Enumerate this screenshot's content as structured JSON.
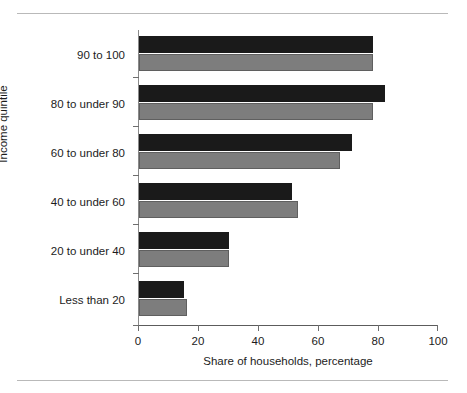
{
  "chart_data": {
    "type": "bar",
    "orientation": "horizontal",
    "title": "",
    "xlabel": "Share of households, percentage",
    "ylabel": "Income quintile",
    "categories": [
      "Less than 20",
      "20 to under 40",
      "40 to under 60",
      "60 to under 80",
      "80 to under 90",
      "90 to 100"
    ],
    "series": [
      {
        "name": "2007",
        "color": "#1a1a1a",
        "values": [
          15,
          30,
          51,
          71,
          82,
          78
        ]
      },
      {
        "name": "2004",
        "color": "#7d7d7d",
        "values": [
          16,
          30,
          53,
          67,
          78,
          78
        ]
      }
    ],
    "xlim": [
      0,
      100
    ],
    "xticks": [
      0,
      20,
      40,
      60,
      80,
      100
    ],
    "xtick_labels": [
      "0",
      "20",
      "40",
      "60",
      "80",
      "100"
    ],
    "grid": false,
    "legend_position": "bottom-right",
    "legend_entries": [
      "2007",
      "2004"
    ]
  }
}
